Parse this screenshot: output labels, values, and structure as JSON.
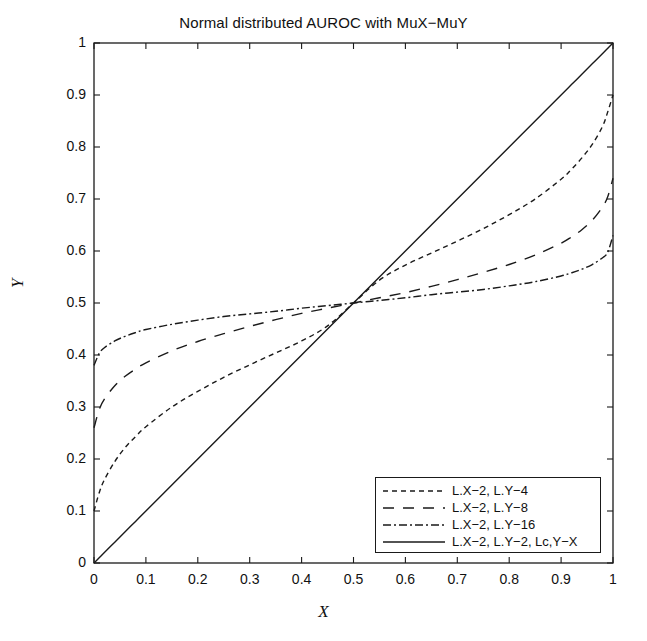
{
  "chart_data": {
    "type": "line",
    "title": "Normal distributed AUROC with MuX−MuY",
    "xlabel": "X",
    "ylabel": "Y",
    "xlim": [
      0,
      1
    ],
    "ylim": [
      0,
      1
    ],
    "grid": false,
    "legend_position": "lower right",
    "xticks": [
      "0",
      "0.1",
      "0.2",
      "0.3",
      "0.4",
      "0.5",
      "0.6",
      "0.7",
      "0.8",
      "0.9",
      "1"
    ],
    "yticks": [
      "0",
      "0.1",
      "0.2",
      "0.3",
      "0.4",
      "0.5",
      "0.6",
      "0.7",
      "0.8",
      "0.9",
      "1"
    ],
    "x": [
      0,
      0.01,
      0.02,
      0.04,
      0.06,
      0.08,
      0.1,
      0.15,
      0.2,
      0.25,
      0.3,
      0.35,
      0.4,
      0.45,
      0.5,
      0.55,
      0.6,
      0.65,
      0.7,
      0.75,
      0.8,
      0.85,
      0.9,
      0.92,
      0.94,
      0.96,
      0.98,
      0.99,
      1
    ],
    "series": [
      {
        "name": "L.X−2, L.Y−4",
        "style": "dotted",
        "values": [
          0.1,
          0.135,
          0.16,
          0.195,
          0.222,
          0.243,
          0.262,
          0.3,
          0.33,
          0.357,
          0.381,
          0.404,
          0.427,
          0.456,
          0.5,
          0.544,
          0.573,
          0.596,
          0.619,
          0.643,
          0.67,
          0.7,
          0.738,
          0.757,
          0.779,
          0.805,
          0.84,
          0.868,
          0.9
        ]
      },
      {
        "name": "L.X−2, L.Y−8",
        "style": "dashed",
        "values": [
          0.26,
          0.295,
          0.315,
          0.341,
          0.359,
          0.373,
          0.385,
          0.408,
          0.426,
          0.441,
          0.455,
          0.468,
          0.48,
          0.49,
          0.5,
          0.51,
          0.52,
          0.532,
          0.545,
          0.559,
          0.574,
          0.592,
          0.615,
          0.627,
          0.641,
          0.659,
          0.685,
          0.705,
          0.74
        ]
      },
      {
        "name": "L.X−2, L.Y−16",
        "style": "dashdot",
        "values": [
          0.38,
          0.403,
          0.414,
          0.427,
          0.436,
          0.443,
          0.449,
          0.459,
          0.467,
          0.474,
          0.479,
          0.484,
          0.49,
          0.495,
          0.5,
          0.505,
          0.51,
          0.516,
          0.521,
          0.526,
          0.533,
          0.541,
          0.552,
          0.558,
          0.565,
          0.574,
          0.587,
          0.598,
          0.63
        ]
      },
      {
        "name": "L.X−2, L.Y−2, Lc,Y−X",
        "style": "solid",
        "values": [
          0,
          0.01,
          0.02,
          0.04,
          0.06,
          0.08,
          0.1,
          0.15,
          0.2,
          0.25,
          0.3,
          0.35,
          0.4,
          0.45,
          0.5,
          0.55,
          0.6,
          0.65,
          0.7,
          0.75,
          0.8,
          0.85,
          0.9,
          0.92,
          0.94,
          0.96,
          0.98,
          0.99,
          1
        ]
      }
    ]
  },
  "legend": {
    "entries": [
      {
        "label": "L.X−2, L.Y−4"
      },
      {
        "label": "L.X−2, L.Y−8"
      },
      {
        "label": "L.X−2, L.Y−16"
      },
      {
        "label": "L.X−2, L.Y−2, Lc,Y−X"
      }
    ]
  },
  "colors": {
    "line": "#1a1a1a",
    "axis": "#1a1a1a",
    "background": "#ffffff"
  }
}
